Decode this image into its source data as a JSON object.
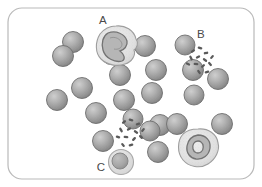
{
  "figure": {
    "width": 262,
    "height": 187,
    "background_color": "#ffffff",
    "frame": {
      "name": "rounded-rectangle-border",
      "x": 8,
      "y": 8,
      "width": 246,
      "height": 171,
      "corner_radius": 14,
      "stroke_color": "#b9b9b9",
      "stroke_width": 1.2,
      "fill_color": "#ffffff"
    }
  },
  "labels": [
    {
      "id": "A",
      "text": "A",
      "x": 103,
      "y": 24,
      "points_to": "band-neutrophil-cell"
    },
    {
      "id": "B",
      "text": "B",
      "x": 201,
      "y": 38,
      "points_to": "bacteria-cluster-upper-right"
    },
    {
      "id": "C",
      "text": "C",
      "x": 101,
      "y": 171,
      "points_to": "lymphocyte-cell"
    }
  ],
  "colors": {
    "rbc_highlight": "#c9c9c9",
    "rbc_mid": "#a0a0a0",
    "rbc_edge": "#7d7d7d",
    "rbc_stroke": "#6f6f6f",
    "wbc_fill": "#e2e2e2",
    "wbc_stroke": "#9a9a9a",
    "nucleus_fill": "#b4b4b4",
    "nucleus_stroke": "#777777",
    "bacteria_fill": "#5a5a5a",
    "lymphocyte_cytoplasm": "#dedede",
    "lymphocyte_nucleus": "#a5a5a5",
    "label_color": "#4a4a4a",
    "frame_stroke": "#b9b9b9"
  },
  "red_blood_cells": [
    {
      "id": "rbc-01",
      "cx": 73,
      "cy": 42,
      "r": 10.5
    },
    {
      "id": "rbc-02",
      "cx": 145,
      "cy": 46,
      "r": 10.5
    },
    {
      "id": "rbc-03",
      "cx": 193,
      "cy": 70,
      "r": 10.5
    },
    {
      "id": "rbc-04",
      "cx": 218,
      "cy": 79,
      "r": 10.5
    },
    {
      "id": "rbc-05",
      "cx": 194,
      "cy": 95,
      "r": 10.0
    },
    {
      "id": "rbc-06",
      "cx": 156,
      "cy": 70,
      "r": 10.5
    },
    {
      "id": "rbc-07",
      "cx": 120,
      "cy": 75,
      "r": 10.5
    },
    {
      "id": "rbc-08",
      "cx": 63,
      "cy": 56,
      "r": 10.5
    },
    {
      "id": "rbc-09",
      "cx": 82,
      "cy": 88,
      "r": 10.5
    },
    {
      "id": "rbc-10",
      "cx": 57,
      "cy": 100,
      "r": 10.5
    },
    {
      "id": "rbc-11",
      "cx": 124,
      "cy": 100,
      "r": 10.5
    },
    {
      "id": "rbc-12",
      "cx": 152,
      "cy": 93,
      "r": 10.5
    },
    {
      "id": "rbc-13",
      "cx": 96,
      "cy": 113,
      "r": 10.5
    },
    {
      "id": "rbc-14",
      "cx": 160,
      "cy": 125,
      "r": 10.5
    },
    {
      "id": "rbc-15",
      "cx": 177,
      "cy": 124,
      "r": 10.5
    },
    {
      "id": "rbc-16",
      "cx": 222,
      "cy": 124,
      "r": 10.5
    },
    {
      "id": "rbc-17",
      "cx": 103,
      "cy": 141,
      "r": 10.5
    },
    {
      "id": "rbc-18",
      "cx": 158,
      "cy": 152,
      "r": 10.5
    },
    {
      "id": "rbc-19",
      "cx": 150,
      "cy": 131,
      "r": 10.0
    },
    {
      "id": "rbc-20",
      "cx": 185,
      "cy": 45,
      "r": 10.0
    },
    {
      "id": "rbc-21",
      "cx": 133,
      "cy": 119,
      "r": 10.0
    },
    {
      "id": "rbc-22",
      "cx": 111,
      "cy": 55,
      "r": 9.5
    }
  ],
  "white_blood_cells": [
    {
      "id": "band-neutrophil-cell",
      "name": "band-neutrophil",
      "cx": 116,
      "cy": 45,
      "rx": 20,
      "ry": 19,
      "label": "A",
      "nucleus_shape": "band-horseshoe"
    },
    {
      "id": "segmented-neutrophil-cell",
      "name": "segmented-neutrophil",
      "cx": 198,
      "cy": 148,
      "rx": 20,
      "ry": 19,
      "label": "",
      "nucleus_shape": "ring-lobed"
    }
  ],
  "lymphocyte": {
    "id": "lymphocyte-cell",
    "name": "lymphocyte",
    "cx": 121,
    "cy": 162,
    "outer_r": 12.5,
    "nucleus_r": 8.0,
    "label": "C"
  },
  "bacteria_clusters": [
    {
      "id": "bacteria-cluster-upper-right",
      "name": "bacilli-cluster-upper-right",
      "label": "B",
      "count": 13,
      "rods": [
        {
          "x": 193,
          "y": 51,
          "w": 4.6,
          "h": 2.3,
          "rot": -38
        },
        {
          "x": 200,
          "y": 48,
          "w": 4.8,
          "h": 2.3,
          "rot": 20
        },
        {
          "x": 206,
          "y": 53,
          "w": 4.6,
          "h": 2.3,
          "rot": -12
        },
        {
          "x": 191,
          "y": 58,
          "w": 5.0,
          "h": 2.3,
          "rot": 62
        },
        {
          "x": 198,
          "y": 57,
          "w": 4.6,
          "h": 2.3,
          "rot": -28
        },
        {
          "x": 205,
          "y": 60,
          "w": 4.8,
          "h": 2.3,
          "rot": 35
        },
        {
          "x": 212,
          "y": 57,
          "w": 4.6,
          "h": 2.3,
          "rot": -50
        },
        {
          "x": 196,
          "y": 64,
          "w": 4.8,
          "h": 2.3,
          "rot": 8
        },
        {
          "x": 203,
          "y": 66,
          "w": 4.6,
          "h": 2.3,
          "rot": -42
        },
        {
          "x": 210,
          "y": 64,
          "w": 4.8,
          "h": 2.3,
          "rot": 48
        },
        {
          "x": 188,
          "y": 64,
          "w": 4.6,
          "h": 2.3,
          "rot": 25
        },
        {
          "x": 207,
          "y": 72,
          "w": 4.8,
          "h": 2.3,
          "rot": -18
        },
        {
          "x": 199,
          "y": 72,
          "w": 4.6,
          "h": 2.3,
          "rot": 55
        }
      ]
    },
    {
      "id": "bacteria-cluster-center",
      "name": "bacilli-cluster-center",
      "label": "",
      "count": 13,
      "rods": [
        {
          "x": 124,
          "y": 122,
          "w": 4.6,
          "h": 2.3,
          "rot": -40
        },
        {
          "x": 131,
          "y": 120,
          "w": 4.8,
          "h": 2.3,
          "rot": 18
        },
        {
          "x": 138,
          "y": 124,
          "w": 4.6,
          "h": 2.3,
          "rot": -15
        },
        {
          "x": 121,
          "y": 130,
          "w": 5.0,
          "h": 2.3,
          "rot": 60
        },
        {
          "x": 129,
          "y": 129,
          "w": 4.6,
          "h": 2.3,
          "rot": -30
        },
        {
          "x": 136,
          "y": 132,
          "w": 4.8,
          "h": 2.3,
          "rot": 33
        },
        {
          "x": 143,
          "y": 130,
          "w": 4.6,
          "h": 2.3,
          "rot": -52
        },
        {
          "x": 126,
          "y": 137,
          "w": 4.8,
          "h": 2.3,
          "rot": 6
        },
        {
          "x": 134,
          "y": 139,
          "w": 4.6,
          "h": 2.3,
          "rot": -45
        },
        {
          "x": 141,
          "y": 137,
          "w": 4.8,
          "h": 2.3,
          "rot": 46
        },
        {
          "x": 118,
          "y": 137,
          "w": 4.6,
          "h": 2.3,
          "rot": 22
        },
        {
          "x": 131,
          "y": 145,
          "w": 4.8,
          "h": 2.3,
          "rot": -20
        },
        {
          "x": 123,
          "y": 145,
          "w": 4.6,
          "h": 2.3,
          "rot": 52
        }
      ]
    }
  ]
}
